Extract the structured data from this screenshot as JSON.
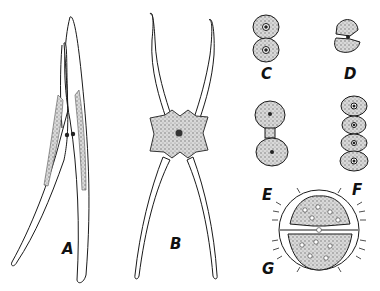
{
  "figure": {
    "type": "scientific-illustration",
    "background_color": "#ffffff",
    "ink_color": "#1a1a1a",
    "stipple_color": "#8a8a8a",
    "panels": [
      {
        "id": "A",
        "label": "A",
        "description": "elongated crossed-horn cell with two tapering arms and granular chloroplasts"
      },
      {
        "id": "B",
        "label": "B",
        "description": "cell with four long curved horns and central stippled body"
      },
      {
        "id": "C",
        "label": "C",
        "description": "rounded two-lobed cell with two nuclei"
      },
      {
        "id": "D",
        "label": "D",
        "description": "compact two-lobed cell with angular outline"
      },
      {
        "id": "E",
        "label": "E",
        "description": "two rounded semicells connected by an isthmus"
      },
      {
        "id": "F",
        "label": "F",
        "description": "chain of four rounded cells"
      },
      {
        "id": "G",
        "label": "G",
        "description": "circular spiny cell divided by a median slit, many pyrenoids"
      }
    ]
  }
}
